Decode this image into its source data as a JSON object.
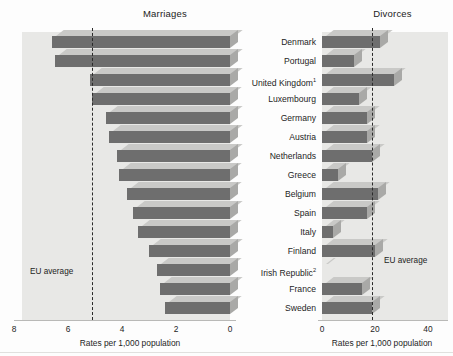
{
  "figure": {
    "left_title": "Marriages",
    "right_title": "Divorces",
    "left_axis_title": "Rates per 1,000 population",
    "right_axis_title": "Rates per 1,000 population",
    "eu_average_label_left": "EU average",
    "eu_average_label_right": "EU average"
  },
  "chart_data": {
    "type": "bar",
    "orientation": "horizontal",
    "layout": "back-to-back paired panels",
    "categories": [
      "Denmark",
      "Portugal",
      "United Kingdom¹",
      "Luxembourg",
      "Germany",
      "Austria",
      "Netherlands",
      "Greece",
      "Belgium",
      "Spain",
      "Italy",
      "Finland",
      "Irish Republic²",
      "France",
      "Sweden"
    ],
    "panels": [
      {
        "name": "Marriages",
        "title": "Marriages",
        "side": "left",
        "xlabel": "Rates per 1,000 population",
        "ticks": [
          "8",
          "6",
          "4",
          "2",
          "0"
        ],
        "tick_values": [
          8,
          6,
          4,
          2,
          0
        ],
        "xlim": [
          8,
          0
        ],
        "axis_reversed": true,
        "eu_average": 5.1,
        "eu_average_label": "EU average",
        "values": [
          6.6,
          6.5,
          5.2,
          5.1,
          4.6,
          4.5,
          4.2,
          4.1,
          3.8,
          3.6,
          3.4,
          3.0,
          2.7,
          2.6,
          2.4
        ]
      },
      {
        "name": "Divorces",
        "title": "Divorces",
        "side": "right",
        "xlabel": "Rates per 1,000 population",
        "ticks": [
          "0",
          "20",
          "40"
        ],
        "tick_values": [
          0,
          20,
          40
        ],
        "xlim": [
          0,
          45
        ],
        "axis_reversed": false,
        "eu_average": 19,
        "eu_average_label": "EU average",
        "values": [
          22,
          12,
          27,
          14,
          17,
          17,
          19,
          6,
          21,
          17,
          4,
          20,
          0,
          15,
          19
        ]
      }
    ],
    "grid": false,
    "legend": "none",
    "colors": {
      "bar_face": "#6e6e6e",
      "bar_top": "#c9c9c7",
      "bar_side": "#a9a9a7",
      "panel_background": "#e8e8e6",
      "eu_average_line": "#2a2a2a"
    }
  }
}
